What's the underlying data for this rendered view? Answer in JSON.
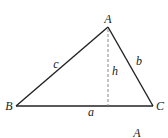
{
  "diagram": {
    "type": "triangle-with-altitude",
    "stroke_color": "#222222",
    "dash_color": "#888888",
    "background": "#ffffff",
    "vertices": {
      "A": {
        "label": "A",
        "x": 108,
        "y": 27,
        "label_x": 108,
        "label_y": 19
      },
      "B": {
        "label": "B",
        "x": 16,
        "y": 106,
        "label_x": 9,
        "label_y": 106
      },
      "C": {
        "label": "C",
        "x": 153,
        "y": 106,
        "label_x": 160,
        "label_y": 106
      }
    },
    "sides": {
      "a": {
        "label": "a",
        "label_x": 91,
        "label_y": 112
      },
      "b": {
        "label": "b",
        "label_x": 139,
        "label_y": 61
      },
      "c": {
        "label": "c",
        "label_x": 56,
        "label_y": 64
      }
    },
    "altitude": {
      "label": "h",
      "foot_x": 108,
      "foot_y": 106,
      "label_x": 115,
      "label_y": 71
    },
    "second_figure_partial": {
      "label": "A",
      "label_x": 137,
      "label_y": 133
    }
  }
}
